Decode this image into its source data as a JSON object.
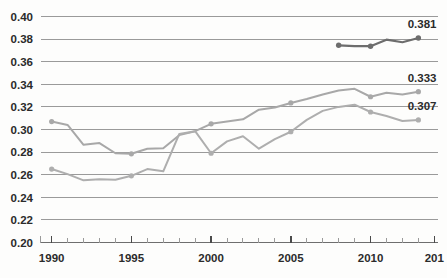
{
  "chart_data": {
    "type": "line",
    "title": "",
    "subtitle": "",
    "xlabel": "",
    "ylabel": "",
    "xlim": [
      1989.3,
      2014.2
    ],
    "ylim": [
      0.2,
      0.4
    ],
    "grid": true,
    "legend_position": "none",
    "y_ticks": [
      "0.40",
      "0.38",
      "0.36",
      "0.34",
      "0.32",
      "0.30",
      "0.28",
      "0.26",
      "0.24",
      "0.22",
      "0.20"
    ],
    "y_tick_values": [
      0.4,
      0.38,
      0.36,
      0.34,
      0.32,
      0.3,
      0.28,
      0.26,
      0.24,
      0.22,
      0.2
    ],
    "x_ticks": [
      "1990",
      "1995",
      "2000",
      "2005",
      "2010",
      "201"
    ],
    "x_tick_values": [
      1990,
      1995,
      2000,
      2005,
      2010,
      2014
    ],
    "x_minor_start": 1990,
    "x_minor_end": 2014,
    "colors": {
      "series_dark": "#6d6d6d",
      "series_grey_a": "#a8a8a8",
      "series_grey_b": "#aeaeae",
      "gridline": "#9a9a9a",
      "axis": "#6e6e6e",
      "text": "#2b2b2b",
      "background": "#fdfdfc"
    },
    "series": [
      {
        "name": "series-dark",
        "color": "#6d6d6d",
        "end_label": "0.381",
        "x": [
          2008,
          2009,
          2010,
          2011,
          2012,
          2013
        ],
        "values": [
          0.3745,
          0.3737,
          0.3737,
          0.3795,
          0.3772,
          0.381
        ],
        "marker_x": [
          2008,
          2010,
          2013
        ]
      },
      {
        "name": "series-grey-upper",
        "color": "#a8a8a8",
        "end_label": "0.333",
        "x": [
          1990,
          1991,
          1992,
          1993,
          1994,
          1995,
          1996,
          1997,
          1998,
          1999,
          2000,
          2001,
          2002,
          2003,
          2004,
          2005,
          2006,
          2007,
          2008,
          2009,
          2010,
          2011,
          2012,
          2013
        ],
        "values": [
          0.307,
          0.304,
          0.2865,
          0.288,
          0.279,
          0.2785,
          0.283,
          0.2835,
          0.295,
          0.2985,
          0.305,
          0.307,
          0.309,
          0.3175,
          0.3195,
          0.3235,
          0.327,
          0.331,
          0.3345,
          0.336,
          0.329,
          0.3325,
          0.331,
          0.3335
        ],
        "marker_x": [
          1990,
          1995,
          2000,
          2005,
          2010,
          2013
        ]
      },
      {
        "name": "series-grey-lower",
        "color": "#aeaeae",
        "end_label": "0.307",
        "x": [
          1990,
          1991,
          1992,
          1993,
          1994,
          1995,
          1996,
          1997,
          1998,
          1999,
          2000,
          2001,
          2002,
          2003,
          2004,
          2005,
          2006,
          2007,
          2008,
          2009,
          2010,
          2011,
          2012,
          2013
        ],
        "values": [
          0.265,
          0.2605,
          0.255,
          0.256,
          0.2555,
          0.259,
          0.265,
          0.263,
          0.296,
          0.2985,
          0.279,
          0.2895,
          0.294,
          0.283,
          0.2915,
          0.298,
          0.3085,
          0.3165,
          0.32,
          0.322,
          0.3155,
          0.312,
          0.3075,
          0.3085
        ],
        "marker_x": [
          1990,
          1995,
          2000,
          2005,
          2010,
          2013
        ]
      }
    ]
  }
}
